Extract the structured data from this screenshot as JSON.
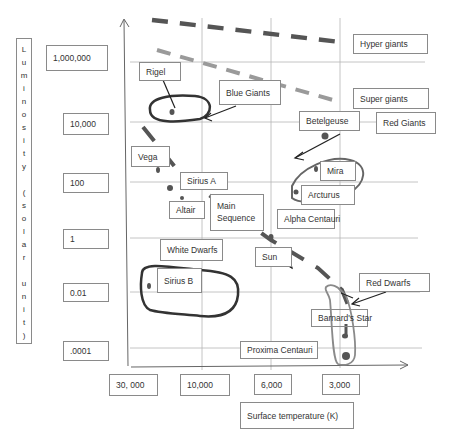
{
  "chart_data": {
    "type": "scatter",
    "xlabel": "Surface temperature (K)",
    "ylabel": "Luminosity (solar unit)",
    "x_ticks": [
      "30, 000",
      "10,000",
      "6,000",
      "3,000"
    ],
    "y_ticks": [
      "1,000,000",
      "10,000",
      "100",
      "1",
      "0.01",
      ".0001"
    ],
    "regions": [
      "Hyper giants",
      "Super giants",
      "Blue Giants",
      "Red Giants",
      "Main Sequence",
      "White Dwarfs",
      "Red Dwarfs"
    ],
    "stars": [
      {
        "name": "Rigel",
        "temperature": "~25,000",
        "luminosity": "~10,000-100,000"
      },
      {
        "name": "Betelgeuse",
        "temperature": "~3,500",
        "luminosity": "~10,000"
      },
      {
        "name": "Vega",
        "temperature": "~10,000",
        "luminosity": "~100"
      },
      {
        "name": "Sirius A",
        "temperature": "~10,000",
        "luminosity": "~50"
      },
      {
        "name": "Altair",
        "temperature": "~8,000",
        "luminosity": "~10"
      },
      {
        "name": "Mira",
        "temperature": "~3,000",
        "luminosity": "~100"
      },
      {
        "name": "Arcturus",
        "temperature": "~4,500",
        "luminosity": "~100"
      },
      {
        "name": "Alpha Centauri",
        "temperature": "~6,000",
        "luminosity": "~1"
      },
      {
        "name": "Sun",
        "temperature": "6,000",
        "luminosity": "1"
      },
      {
        "name": "Sirius B",
        "temperature": "~25,000",
        "luminosity": "~0.01"
      },
      {
        "name": "Barnard's Star",
        "temperature": "~3,000",
        "luminosity": "~0.001"
      },
      {
        "name": "Proxima Centauri",
        "temperature": "~3,000",
        "luminosity": "~0.0001"
      }
    ]
  },
  "y_axis": {
    "label_chars": [
      "L",
      "u",
      "m",
      "i",
      "n",
      "o",
      "s",
      "i",
      "t",
      "y",
      "",
      "(",
      "s",
      "o",
      "l",
      "a",
      "r",
      "",
      "u",
      "n",
      "i",
      "t",
      ")"
    ],
    "ticks": [
      "1,000,000",
      "10,000",
      "100",
      "1",
      "0.01",
      ".0001"
    ]
  },
  "x_axis": {
    "ticks": [
      "30, 000",
      "10,000",
      "6,000",
      "3,000"
    ],
    "label": "Surface temperature (K)"
  },
  "labels": {
    "hyper_giants": "Hyper giants",
    "super_giants": "Super giants",
    "blue_giants": "Blue Giants",
    "red_giants": "Red Giants",
    "main_sequence_1": "Main",
    "main_sequence_2": "Sequence",
    "white_dwarfs": "White Dwarfs",
    "red_dwarfs": "Red Dwarfs",
    "rigel": "Rigel",
    "betelgeuse": "Betelgeuse",
    "vega": "Vega",
    "sirius_a": "Sirius A",
    "altair": "Altair",
    "mira": "Mira",
    "arcturus": "Arcturus",
    "alpha_centauri": "Alpha Centauri",
    "sun": "Sun",
    "sirius_b": "Sirius B",
    "barnards_star": "Barnard's Star",
    "proxima_centauri": "Proxima Centauri"
  },
  "colors": {
    "hyper_line": "#555555",
    "super_line": "#9a9a9a",
    "main_sequence_line": "#555555",
    "blue_giants_ring": "#333333",
    "red_giants_ring": "#666666",
    "red_dwarfs_ring": "#8a8a8a"
  }
}
